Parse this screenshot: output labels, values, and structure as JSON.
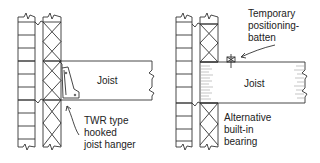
{
  "diagrams": [
    {
      "id": "left",
      "joist_label": "Joist",
      "callout_lines": [
        "TWR type",
        "hooked",
        "joist hanger"
      ]
    },
    {
      "id": "right",
      "joist_label": "Joist",
      "top_callout_lines": [
        "Temporary",
        "positioning-",
        "batten"
      ],
      "bottom_callout_lines": [
        "Alternative",
        "built-in",
        "bearing"
      ]
    }
  ],
  "colors": {
    "line": "#333333",
    "background": "#ffffff"
  }
}
